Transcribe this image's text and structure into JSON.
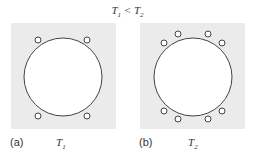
{
  "title": {
    "left": "T",
    "left_sub": "1",
    "op": " < ",
    "right": "T",
    "right_sub": "2"
  },
  "panels": [
    {
      "label": "(a)",
      "temp": "T",
      "temp_sub": "1",
      "particles": 4
    },
    {
      "label": "(b)",
      "temp": "T",
      "temp_sub": "2",
      "particles": 8
    }
  ],
  "colors": {
    "panel_bg": "#ebebeb",
    "stroke": "#444444"
  }
}
